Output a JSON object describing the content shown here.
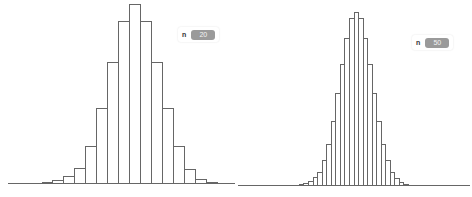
{
  "chart_data": [
    {
      "type": "bar",
      "title": "",
      "xlabel": "",
      "ylabel": "",
      "grid": false,
      "legend": null,
      "control": {
        "label": "n",
        "value": "20"
      },
      "style": {
        "fill": "#ffffff",
        "stroke": "#666666"
      },
      "baseline_y": 183,
      "x_range": [
        8,
        235
      ],
      "bars": [
        {
          "x0": 42,
          "x1": 52,
          "top": 182
        },
        {
          "x0": 52,
          "x1": 63,
          "top": 180
        },
        {
          "x0": 63,
          "x1": 74,
          "top": 176
        },
        {
          "x0": 74,
          "x1": 85,
          "top": 168
        },
        {
          "x0": 85,
          "x1": 96,
          "top": 146
        },
        {
          "x0": 96,
          "x1": 107,
          "top": 108
        },
        {
          "x0": 107,
          "x1": 118,
          "top": 62
        },
        {
          "x0": 118,
          "x1": 129,
          "top": 21
        },
        {
          "x0": 129,
          "x1": 140,
          "top": 4
        },
        {
          "x0": 140,
          "x1": 151,
          "top": 21
        },
        {
          "x0": 151,
          "x1": 162,
          "top": 62
        },
        {
          "x0": 162,
          "x1": 173,
          "top": 108
        },
        {
          "x0": 173,
          "x1": 184,
          "top": 146
        },
        {
          "x0": 184,
          "x1": 195,
          "top": 169
        },
        {
          "x0": 195,
          "x1": 206,
          "top": 179
        },
        {
          "x0": 206,
          "x1": 217,
          "top": 182
        }
      ],
      "relative_values": [
        0.5,
        1.5,
        3.9,
        8.6,
        20.5,
        41.0,
        65.9,
        88.1,
        97.3,
        88.1,
        65.9,
        41.0,
        20.5,
        7.6,
        2.2,
        0.5
      ]
    },
    {
      "type": "bar",
      "title": "",
      "xlabel": "",
      "ylabel": "",
      "grid": false,
      "legend": null,
      "control": {
        "label": "n",
        "value": "50"
      },
      "style": {
        "fill": "#ffffff",
        "stroke": "#666666"
      },
      "baseline_y": 185,
      "x_range": [
        2,
        234
      ],
      "bars": [
        {
          "x0": 63,
          "x1": 67,
          "top": 184
        },
        {
          "x0": 67,
          "x1": 72,
          "top": 183
        },
        {
          "x0": 72,
          "x1": 77,
          "top": 181
        },
        {
          "x0": 77,
          "x1": 81,
          "top": 177
        },
        {
          "x0": 81,
          "x1": 86,
          "top": 172
        },
        {
          "x0": 86,
          "x1": 90,
          "top": 160
        },
        {
          "x0": 90,
          "x1": 95,
          "top": 144
        },
        {
          "x0": 95,
          "x1": 99,
          "top": 121
        },
        {
          "x0": 99,
          "x1": 104,
          "top": 93
        },
        {
          "x0": 104,
          "x1": 108,
          "top": 64
        },
        {
          "x0": 108,
          "x1": 113,
          "top": 38
        },
        {
          "x0": 113,
          "x1": 118,
          "top": 18
        },
        {
          "x0": 118,
          "x1": 122,
          "top": 12
        },
        {
          "x0": 122,
          "x1": 127,
          "top": 18
        },
        {
          "x0": 127,
          "x1": 131,
          "top": 38
        },
        {
          "x0": 131,
          "x1": 136,
          "top": 64
        },
        {
          "x0": 136,
          "x1": 140,
          "top": 93
        },
        {
          "x0": 140,
          "x1": 145,
          "top": 121
        },
        {
          "x0": 145,
          "x1": 149,
          "top": 144
        },
        {
          "x0": 149,
          "x1": 154,
          "top": 160
        },
        {
          "x0": 154,
          "x1": 158,
          "top": 172
        },
        {
          "x0": 158,
          "x1": 163,
          "top": 178
        },
        {
          "x0": 163,
          "x1": 167,
          "top": 182
        },
        {
          "x0": 167,
          "x1": 172,
          "top": 184
        }
      ],
      "relative_values": [
        0.6,
        1.2,
        2.3,
        4.6,
        7.5,
        14.4,
        23.6,
        36.8,
        52.9,
        69.5,
        84.5,
        96.0,
        99.4,
        96.0,
        84.5,
        69.5,
        52.9,
        36.8,
        23.6,
        14.4,
        7.5,
        4.0,
        1.7,
        0.6
      ]
    }
  ]
}
